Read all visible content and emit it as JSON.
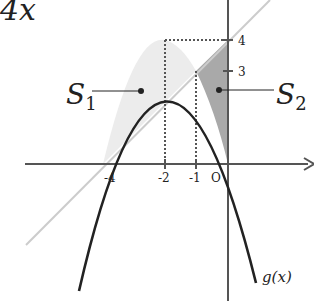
{
  "title_fragment": "4x",
  "functions": {
    "parabola_label": "g(x)",
    "parabola": "g(x) = -x^2 - 4x",
    "line": "y = x + 4"
  },
  "regions": {
    "s1": {
      "letter": "S",
      "sub": "1"
    },
    "s2": {
      "letter": "S",
      "sub": "2"
    }
  },
  "x_ticks": [
    "-4",
    "-2",
    "-1",
    "O"
  ],
  "y_ticks": [
    "4",
    "3"
  ],
  "colors": {
    "curve": "#222222",
    "line": "#cccccc",
    "s1_fill": "#ececec",
    "s2_fill": "#a9a9a9"
  }
}
